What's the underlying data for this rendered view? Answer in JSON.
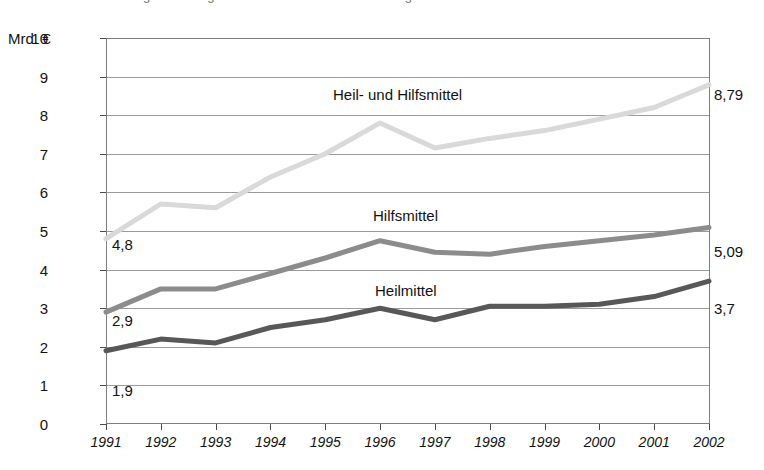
{
  "header": {
    "cropped_title": "Ausgaben der gesetzlichen Krankenversicherung"
  },
  "axis": {
    "unit_label": "Mrd. €",
    "y_ticks": [
      "10",
      "9",
      "8",
      "7",
      "6",
      "5",
      "4",
      "3",
      "2",
      "1",
      "0"
    ],
    "x_ticks": [
      "1991",
      "1992",
      "1993",
      "1994",
      "1995",
      "1996",
      "1997",
      "1998",
      "1999",
      "2000",
      "2001",
      "2002"
    ]
  },
  "series_labels": {
    "total": "Heil- und Hilfsmittel",
    "aids": "Hilfsmittel",
    "remedies": "Heilmittel"
  },
  "value_labels": {
    "total_start": "4,8",
    "total_end": "8,79",
    "aids_start": "2,9",
    "aids_end": "5,09",
    "remedies_start": "1,9",
    "remedies_end": "3,7"
  },
  "colors": {
    "total_line": "#d9d9d9",
    "aids_line": "#8c8c8c",
    "remedies_line": "#585858",
    "grid": "#9a9a9a",
    "border": "#7d7d7d",
    "text": "#111111"
  },
  "chart_data": {
    "type": "line",
    "xlabel": "",
    "ylabel": "Mrd. €",
    "ylim": [
      0,
      10
    ],
    "xlim": [
      "1991",
      "2002"
    ],
    "grid": true,
    "legend": "inline-labels",
    "categories": [
      "1991",
      "1992",
      "1993",
      "1994",
      "1995",
      "1996",
      "1997",
      "1998",
      "1999",
      "2000",
      "2001",
      "2002"
    ],
    "series": [
      {
        "name": "Heil- und Hilfsmittel",
        "color": "#d9d9d9",
        "values": [
          4.8,
          5.7,
          5.6,
          6.4,
          7.0,
          7.8,
          7.15,
          7.4,
          7.6,
          7.9,
          8.2,
          8.79
        ]
      },
      {
        "name": "Hilfsmittel",
        "color": "#8c8c8c",
        "values": [
          2.9,
          3.5,
          3.5,
          3.9,
          4.3,
          4.75,
          4.45,
          4.4,
          4.6,
          4.75,
          4.9,
          5.09
        ]
      },
      {
        "name": "Heilmittel",
        "color": "#585858",
        "values": [
          1.9,
          2.2,
          2.1,
          2.5,
          2.7,
          3.0,
          2.7,
          3.05,
          3.05,
          3.1,
          3.3,
          3.7
        ]
      }
    ]
  }
}
